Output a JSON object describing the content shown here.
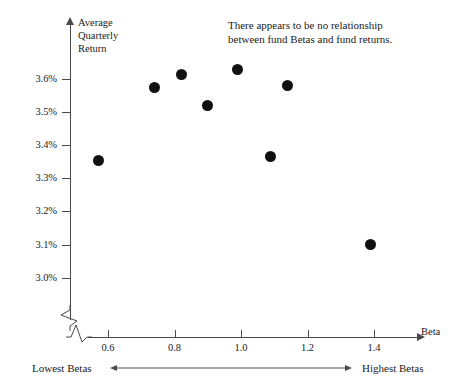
{
  "chart_data": {
    "type": "scatter",
    "title": "",
    "xlabel": "Beta",
    "ylabel": "Average Quarterly Return",
    "ylabel_lines": "Average\nQuarterly\nReturn",
    "xlim": [
      0.5,
      1.5
    ],
    "ylim": [
      2.95,
      3.68
    ],
    "grid": false,
    "legend": null,
    "x_ticks": [
      "0.6",
      "0.8",
      "1.0",
      "1.2",
      "1.4"
    ],
    "x_tick_values": [
      0.6,
      0.8,
      1.0,
      1.2,
      1.4
    ],
    "y_ticks": [
      "3.0%",
      "3.1%",
      "3.2%",
      "3.3%",
      "3.4%",
      "3.5%",
      "3.6%"
    ],
    "y_tick_values": [
      3.0,
      3.1,
      3.2,
      3.3,
      3.4,
      3.5,
      3.6
    ],
    "axis_break_x": true,
    "axis_break_y": true,
    "points": [
      {
        "x": 0.57,
        "y": 3.355
      },
      {
        "x": 0.74,
        "y": 3.575
      },
      {
        "x": 0.82,
        "y": 3.615
      },
      {
        "x": 0.9,
        "y": 3.52
      },
      {
        "x": 0.99,
        "y": 3.63
      },
      {
        "x": 1.09,
        "y": 3.365
      },
      {
        "x": 1.14,
        "y": 3.58
      },
      {
        "x": 1.39,
        "y": 3.1
      }
    ],
    "annotations": [
      {
        "name": "no-relationship-note",
        "text": "There appears to be no relationship\nbetween fund Betas and fund returns."
      }
    ],
    "range_annotation": {
      "low_label": "Lowest Betas",
      "high_label": "Highest Betas"
    },
    "colors": {
      "point": "#111111",
      "axis": "#4a4a4a",
      "text": "#1a1a1a",
      "background": "#ffffff"
    }
  }
}
